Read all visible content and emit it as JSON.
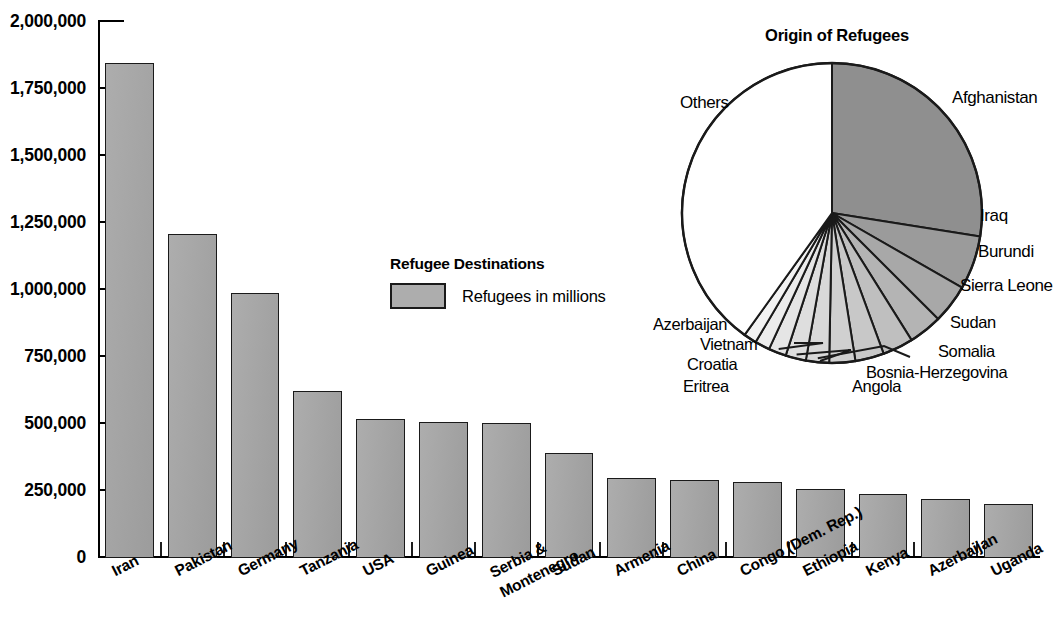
{
  "chart_data": [
    {
      "type": "bar",
      "title": "Refugee Destinations",
      "xlabel": "",
      "ylabel": "",
      "ylim": [
        0,
        2000000
      ],
      "ytick_labels": [
        "2,000,000",
        "1,750,000",
        "1,500,000",
        "1,250,000",
        "1,000,000",
        "750,000",
        "500,000",
        "250,000",
        "0"
      ],
      "ytick_values": [
        2000000,
        1750000,
        1500000,
        1250000,
        1000000,
        750000,
        500000,
        250000,
        0
      ],
      "grid": false,
      "legend_position": "center",
      "legend_entries": [
        "Refugees in millions"
      ],
      "categories": [
        "Iran",
        "Pakistan",
        "Germany",
        "Tanzania",
        "USA",
        "Guinea",
        "Serbia & Montenegro",
        "Sudan",
        "Armenia",
        "China",
        "Congo (Dem. Rep.)",
        "Ethiopia",
        "Kenya",
        "Azerbaijan",
        "Uganda"
      ],
      "values": [
        1840000,
        1200000,
        980000,
        615000,
        510000,
        500000,
        495000,
        385000,
        290000,
        285000,
        275000,
        250000,
        230000,
        212000,
        193000
      ],
      "bar_color": "#a3a3a3"
    },
    {
      "type": "pie",
      "title": "Origin of Refugees",
      "labels": [
        "Afghanistan",
        "Iraq",
        "Burundi",
        "Sierra Leone",
        "Sudan",
        "Somalia",
        "Bosnia-Herzegovina",
        "Angola",
        "Eritrea",
        "Croatia",
        "Vietnam",
        "Azerbaijan",
        "Others"
      ],
      "values": [
        27.5,
        5.8,
        4.2,
        3.6,
        3.3,
        3.1,
        2.8,
        2.5,
        2.2,
        1.9,
        1.6,
        1.4,
        40.1
      ],
      "start_angle_deg": 0,
      "direction": "clockwise"
    }
  ],
  "barchart": {
    "y_axis": {
      "ticks": [
        {
          "label": "2,000,000",
          "value": 2000000
        },
        {
          "label": "1,750,000",
          "value": 1750000
        },
        {
          "label": "1,500,000",
          "value": 1500000
        },
        {
          "label": "1,250,000",
          "value": 1250000
        },
        {
          "label": "1,000,000",
          "value": 1000000
        },
        {
          "label": "750,000",
          "value": 750000
        },
        {
          "label": "500,000",
          "value": 500000
        },
        {
          "label": "250,000",
          "value": 250000
        },
        {
          "label": "0",
          "value": 0
        }
      ]
    },
    "bars": [
      {
        "label": "Iran",
        "value": 1840000,
        "lines": [
          "Iran"
        ]
      },
      {
        "label": "Pakistan",
        "value": 1200000,
        "lines": [
          "Pakistan"
        ]
      },
      {
        "label": "Germany",
        "value": 980000,
        "lines": [
          "Germany"
        ]
      },
      {
        "label": "Tanzania",
        "value": 615000,
        "lines": [
          "Tanzania"
        ]
      },
      {
        "label": "USA",
        "value": 510000,
        "lines": [
          "USA"
        ]
      },
      {
        "label": "Guinea",
        "value": 500000,
        "lines": [
          "Guinea"
        ]
      },
      {
        "label": "Serbia & Montenegro",
        "value": 495000,
        "lines": [
          "Serbia &",
          "Montenegro"
        ]
      },
      {
        "label": "Sudan",
        "value": 385000,
        "lines": [
          "Sudan"
        ]
      },
      {
        "label": "Armenia",
        "value": 290000,
        "lines": [
          "Armenia"
        ]
      },
      {
        "label": "China",
        "value": 285000,
        "lines": [
          "China"
        ]
      },
      {
        "label": "Congo (Dem. Rep.)",
        "value": 275000,
        "lines": [
          "Congo (Dem. Rep.)"
        ]
      },
      {
        "label": "Ethiopia",
        "value": 250000,
        "lines": [
          "Ethiopia"
        ]
      },
      {
        "label": "Kenya",
        "value": 230000,
        "lines": [
          "Kenya"
        ]
      },
      {
        "label": "Azerbaijan",
        "value": 212000,
        "lines": [
          "Azerbaijan"
        ]
      },
      {
        "label": "Uganda",
        "value": 193000,
        "lines": [
          "Uganda"
        ]
      }
    ]
  },
  "legend": {
    "title": "Refugee Destinations",
    "swatch_label": "Refugees in millions",
    "swatch_color": "#adadad"
  },
  "pie": {
    "title": "Origin of Refugees",
    "slices": [
      {
        "label": "Afghanistan",
        "value": 27.5,
        "color": "#8f8f8f"
      },
      {
        "label": "Iraq",
        "value": 5.8,
        "color": "#9b9b9b"
      },
      {
        "label": "Burundi",
        "value": 4.2,
        "color": "#a8a8a8"
      },
      {
        "label": "Sierra Leone",
        "value": 3.6,
        "color": "#b4b4b4"
      },
      {
        "label": "Sudan",
        "value": 3.3,
        "color": "#bfbfbf"
      },
      {
        "label": "Somalia",
        "value": 3.1,
        "color": "#c8c8c8"
      },
      {
        "label": "Bosnia-Herzegovina",
        "value": 2.8,
        "color": "#d0d0d0"
      },
      {
        "label": "Angola",
        "value": 2.5,
        "color": "#d8d8d8"
      },
      {
        "label": "Eritrea",
        "value": 2.2,
        "color": "#dedede"
      },
      {
        "label": "Croatia",
        "value": 1.9,
        "color": "#e5e5e5"
      },
      {
        "label": "Vietnam",
        "value": 1.6,
        "color": "#ececec"
      },
      {
        "label": "Azerbaijan",
        "value": 1.4,
        "color": "#f3f3f3"
      },
      {
        "label": "Others",
        "value": 40.1,
        "color": "#ffffff"
      }
    ]
  }
}
